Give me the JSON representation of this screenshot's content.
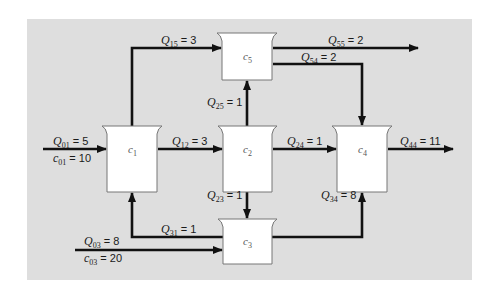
{
  "colors": {
    "background_panel": "#dedede",
    "page": "#ffffff",
    "reactor_fill": "#ffffff",
    "reactor_stroke": "#777777",
    "flow_line": "#111111"
  },
  "reactors": [
    {
      "id": "c1",
      "var": "c",
      "sub": "1"
    },
    {
      "id": "c2",
      "var": "c",
      "sub": "2"
    },
    {
      "id": "c3",
      "var": "c",
      "sub": "3"
    },
    {
      "id": "c4",
      "var": "c",
      "sub": "4"
    },
    {
      "id": "c5",
      "var": "c",
      "sub": "5"
    }
  ],
  "flows": [
    {
      "id": "Q01",
      "var": "Q",
      "sub": "01",
      "value": "= 5",
      "conc_var": "c",
      "conc_sub": "01",
      "conc_value": "= 10"
    },
    {
      "id": "Q12",
      "var": "Q",
      "sub": "12",
      "value": "= 3"
    },
    {
      "id": "Q15",
      "var": "Q",
      "sub": "15",
      "value": "= 3"
    },
    {
      "id": "Q55",
      "var": "Q",
      "sub": "55",
      "value": "= 2"
    },
    {
      "id": "Q54",
      "var": "Q",
      "sub": "54",
      "value": "= 2"
    },
    {
      "id": "Q25",
      "var": "Q",
      "sub": "25",
      "value": "= 1"
    },
    {
      "id": "Q24",
      "var": "Q",
      "sub": "24",
      "value": "= 1"
    },
    {
      "id": "Q44",
      "var": "Q",
      "sub": "44",
      "value": "= 11"
    },
    {
      "id": "Q23",
      "var": "Q",
      "sub": "23",
      "value": "= 1"
    },
    {
      "id": "Q34",
      "var": "Q",
      "sub": "34",
      "value": "= 8"
    },
    {
      "id": "Q31",
      "var": "Q",
      "sub": "31",
      "value": "= 1"
    },
    {
      "id": "Q03",
      "var": "Q",
      "sub": "03",
      "value": "= 8",
      "conc_var": "c",
      "conc_sub": "03",
      "conc_value": "= 20"
    }
  ]
}
